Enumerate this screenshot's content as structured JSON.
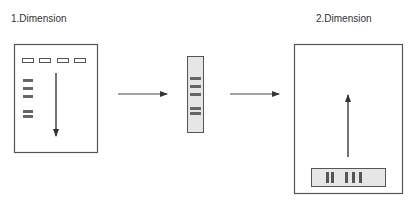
{
  "labels": {
    "first_dimension": "1.Dimension",
    "second_dimension": "2.Dimension"
  },
  "colors": {
    "outline": "#555555",
    "band": "#666666",
    "arrow": "#444444",
    "strip_fill": "#e6e6e6",
    "text": "#333333"
  },
  "first_gel": {
    "wells": 4,
    "bands": 5,
    "arrow_direction": "down"
  },
  "strip": {
    "bands": 5
  },
  "second_gel": {
    "arrow_direction": "up",
    "strip_band_groups": [
      2,
      3
    ]
  },
  "transfer_arrows": 2
}
